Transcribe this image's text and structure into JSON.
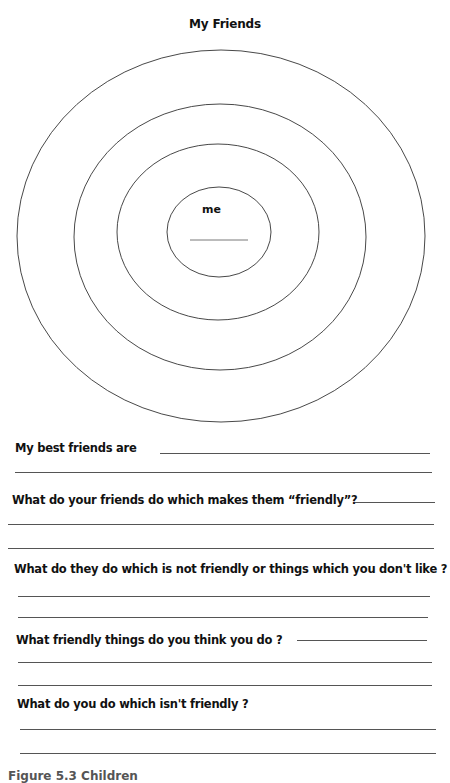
{
  "worksheet": {
    "title": "My Friends",
    "diagram": {
      "center_label": "me",
      "rings": 4,
      "stroke_color": "#333333"
    },
    "questions": [
      {
        "text": "My best friends are"
      },
      {
        "text": "What do your friends do which makes them “friendly”?"
      },
      {
        "text": "What do they do which is not friendly or things which you don't like ?"
      },
      {
        "text": "What friendly things do you think you do ?"
      },
      {
        "text": "What do you do which isn't friendly ?"
      }
    ],
    "caption": "Figure 5.3  Children"
  }
}
